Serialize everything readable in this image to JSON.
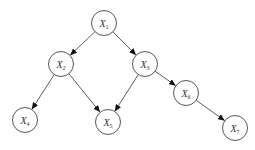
{
  "diagram": {
    "type": "directed-acyclic-graph",
    "node_radius": 12.5,
    "colors": {
      "background": "#ffffff",
      "node_stroke": "#444444",
      "edge": "#333333",
      "text": "#333333"
    },
    "nodes": [
      {
        "id": "X1",
        "var": "X",
        "sub": "1",
        "x": 104,
        "y": 23
      },
      {
        "id": "X2",
        "var": "X",
        "sub": "2",
        "x": 61,
        "y": 64
      },
      {
        "id": "X3",
        "var": "X",
        "sub": "3",
        "x": 145,
        "y": 64
      },
      {
        "id": "X4",
        "var": "X",
        "sub": "4",
        "x": 25,
        "y": 120
      },
      {
        "id": "X5",
        "var": "X",
        "sub": "5",
        "x": 108,
        "y": 122
      },
      {
        "id": "X6",
        "var": "X",
        "sub": "6",
        "x": 186,
        "y": 93
      },
      {
        "id": "X7",
        "var": "X",
        "sub": "7",
        "x": 235,
        "y": 128
      }
    ],
    "edges": [
      {
        "from": "X1",
        "to": "X2"
      },
      {
        "from": "X1",
        "to": "X3"
      },
      {
        "from": "X2",
        "to": "X4"
      },
      {
        "from": "X2",
        "to": "X5"
      },
      {
        "from": "X3",
        "to": "X5"
      },
      {
        "from": "X3",
        "to": "X6"
      },
      {
        "from": "X6",
        "to": "X7"
      }
    ]
  }
}
